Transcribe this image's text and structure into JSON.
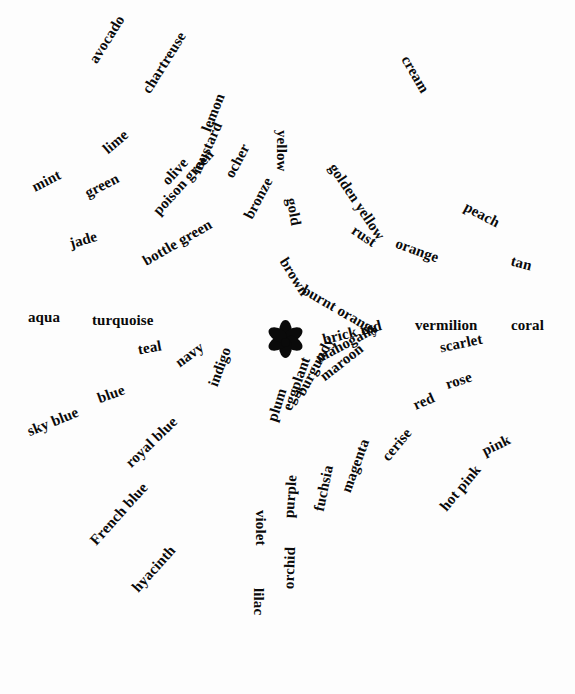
{
  "figure": {
    "type": "radial-word-diagram",
    "title": "",
    "background_color": "#fdfdfd",
    "text_color": "#0a0a0a",
    "center": {
      "icon": "six-petal-flower-asterisk-icon",
      "x": 285,
      "y": 342,
      "petals": 6
    }
  },
  "chart_data": {
    "type": "scatter",
    "title": "",
    "xlabel": "",
    "ylabel": "",
    "layout": "radial spokes of colour-term labels around a central floral asterisk",
    "labels": [
      "cream",
      "yellow",
      "golden yellow",
      "gold",
      "avocado",
      "chartreuse",
      "lemon",
      "ocher",
      "bronze",
      "mustard",
      "olive",
      "poison green",
      "bottle green",
      "lime",
      "green",
      "mint",
      "jade",
      "aqua",
      "turquoise",
      "teal",
      "navy",
      "indigo",
      "blue",
      "sky blue",
      "royal blue",
      "French blue",
      "hyacinth",
      "violet",
      "lilac",
      "purple",
      "orchid",
      "fuchsia",
      "magenta",
      "cerise",
      "plum",
      "eggplant",
      "burgundy",
      "maroon",
      "mahogany",
      "brick red",
      "brown",
      "burnt orange",
      "rust",
      "orange",
      "peach",
      "tan",
      "vermilion",
      "coral",
      "scarlet",
      "rose",
      "red",
      "pink",
      "hot pink"
    ]
  },
  "words": [
    {
      "text": "avocado",
      "x": 93,
      "y": 62,
      "rot": 58,
      "size": 15
    },
    {
      "text": "chartreuse",
      "x": 146,
      "y": 92,
      "rot": 58,
      "size": 15
    },
    {
      "text": "lemon",
      "x": 206,
      "y": 131,
      "rot": 68,
      "size": 15
    },
    {
      "text": "yellow",
      "x": 281,
      "y": 130,
      "rot": -90,
      "size": 15
    },
    {
      "text": "cream",
      "x": 405,
      "y": 57,
      "rot": -60,
      "size": 15
    },
    {
      "text": "golden yellow",
      "x": 332,
      "y": 165,
      "rot": -56,
      "size": 15
    },
    {
      "text": "ocher",
      "x": 229,
      "y": 177,
      "rot": 62,
      "size": 15
    },
    {
      "text": "bronze",
      "x": 248,
      "y": 218,
      "rot": 62,
      "size": 15
    },
    {
      "text": "mustard",
      "x": 196,
      "y": 173,
      "rot": 66,
      "size": 15
    },
    {
      "text": "lime",
      "x": 105,
      "y": 151,
      "rot": 40,
      "size": 15
    },
    {
      "text": "mint",
      "x": 33,
      "y": 188,
      "rot": 27,
      "size": 15
    },
    {
      "text": "green",
      "x": 86,
      "y": 194,
      "rot": 27,
      "size": 15
    },
    {
      "text": "olive",
      "x": 165,
      "y": 183,
      "rot": 48,
      "size": 15
    },
    {
      "text": "poison green",
      "x": 156,
      "y": 213,
      "rot": 48,
      "size": 15
    },
    {
      "text": "jade",
      "x": 70,
      "y": 244,
      "rot": 16,
      "size": 15
    },
    {
      "text": "bottle green",
      "x": 144,
      "y": 262,
      "rot": 30,
      "size": 15
    },
    {
      "text": "gold",
      "x": 291,
      "y": 198,
      "rot": -80,
      "size": 15
    },
    {
      "text": "brown",
      "x": 283,
      "y": 259,
      "rot": -58,
      "size": 15
    },
    {
      "text": "rust",
      "x": 353,
      "y": 229,
      "rot": -34,
      "size": 15
    },
    {
      "text": "burnt orange",
      "x": 303,
      "y": 289,
      "rot": -30,
      "size": 15
    },
    {
      "text": "orange",
      "x": 396,
      "y": 243,
      "rot": -20,
      "size": 15
    },
    {
      "text": "peach",
      "x": 465,
      "y": 206,
      "rot": -28,
      "size": 15
    },
    {
      "text": "tan",
      "x": 511,
      "y": 261,
      "rot": -14,
      "size": 15
    },
    {
      "text": "aqua",
      "x": 28,
      "y": 317,
      "rot": 0,
      "size": 15
    },
    {
      "text": "turquoise",
      "x": 92,
      "y": 320,
      "rot": 0,
      "size": 15
    },
    {
      "text": "teal",
      "x": 138,
      "y": 350,
      "rot": 10,
      "size": 15
    },
    {
      "text": "navy",
      "x": 177,
      "y": 364,
      "rot": 36,
      "size": 15
    },
    {
      "text": "indigo",
      "x": 213,
      "y": 386,
      "rot": 70,
      "size": 15
    },
    {
      "text": "vermilion",
      "x": 415,
      "y": 325,
      "rot": 0,
      "size": 15
    },
    {
      "text": "coral",
      "x": 511,
      "y": 325,
      "rot": 0,
      "size": 15
    },
    {
      "text": "brick red",
      "x": 323,
      "y": 340,
      "rot": 14,
      "size": 15
    },
    {
      "text": "scarlet",
      "x": 440,
      "y": 348,
      "rot": 12,
      "size": 15
    },
    {
      "text": "mahogany",
      "x": 317,
      "y": 359,
      "rot": 28,
      "size": 15
    },
    {
      "text": "maroon",
      "x": 322,
      "y": 378,
      "rot": 38,
      "size": 15
    },
    {
      "text": "rose",
      "x": 446,
      "y": 385,
      "rot": 18,
      "size": 15
    },
    {
      "text": "red",
      "x": 414,
      "y": 406,
      "rot": 24,
      "size": 15
    },
    {
      "text": "burgundy",
      "x": 300,
      "y": 395,
      "rot": 62,
      "size": 15
    },
    {
      "text": "eggplant",
      "x": 287,
      "y": 410,
      "rot": 70,
      "size": 15
    },
    {
      "text": "plum",
      "x": 272,
      "y": 421,
      "rot": 72,
      "size": 15
    },
    {
      "text": "blue",
      "x": 98,
      "y": 399,
      "rot": 20,
      "size": 15
    },
    {
      "text": "sky blue",
      "x": 28,
      "y": 432,
      "rot": 22,
      "size": 15
    },
    {
      "text": "royal blue",
      "x": 128,
      "y": 465,
      "rot": 44,
      "size": 15
    },
    {
      "text": "French blue",
      "x": 93,
      "y": 543,
      "rot": 48,
      "size": 15
    },
    {
      "text": "hyacinth",
      "x": 135,
      "y": 590,
      "rot": 48,
      "size": 15
    },
    {
      "text": "pink",
      "x": 483,
      "y": 452,
      "rot": 26,
      "size": 15
    },
    {
      "text": "cerise",
      "x": 385,
      "y": 459,
      "rot": 50,
      "size": 15
    },
    {
      "text": "magenta",
      "x": 346,
      "y": 492,
      "rot": 70,
      "size": 15
    },
    {
      "text": "hot pink",
      "x": 443,
      "y": 509,
      "rot": 50,
      "size": 15
    },
    {
      "text": "fuchsia",
      "x": 319,
      "y": 511,
      "rot": 78,
      "size": 15
    },
    {
      "text": "purple",
      "x": 289,
      "y": 518,
      "rot": 86,
      "size": 15
    },
    {
      "text": "violet",
      "x": 260,
      "y": 510,
      "rot": -90,
      "size": 15
    },
    {
      "text": "lilac",
      "x": 258,
      "y": 588,
      "rot": -90,
      "size": 15
    },
    {
      "text": "orchid",
      "x": 289,
      "y": 589,
      "rot": 88,
      "size": 15
    }
  ]
}
